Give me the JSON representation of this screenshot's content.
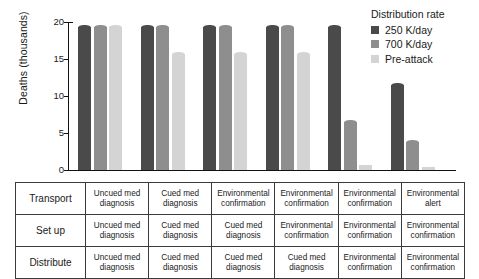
{
  "chart_data": {
    "type": "bar",
    "title": "",
    "xlabel": "",
    "ylabel": "Deaths (thousands)",
    "ylim": [
      0,
      20
    ],
    "yticks": [
      0,
      5,
      10,
      15,
      20
    ],
    "ytick_labels": [
      "0",
      "5",
      "10",
      "15",
      "20"
    ],
    "grid": false,
    "legend_position": "top-right",
    "legend_title": "Distribution rate",
    "categories": [
      "Scenario 1",
      "Scenario 2",
      "Scenario 3",
      "Scenario 4",
      "Scenario 5",
      "Scenario 6"
    ],
    "series": [
      {
        "name": "250 K/day",
        "color": "#4a4a4a",
        "values": [
          19.6,
          19.6,
          19.6,
          19.6,
          19.6,
          11.7
        ]
      },
      {
        "name": "700 K/day",
        "color": "#8e8e8e",
        "values": [
          19.6,
          19.6,
          19.6,
          19.6,
          6.7,
          4.0
        ]
      },
      {
        "name": "Pre-attack",
        "color": "#d4d4d4",
        "values": [
          19.6,
          16.0,
          16.0,
          16.0,
          0.7,
          0.35
        ]
      }
    ]
  },
  "legend": {
    "title": "Distribution rate",
    "items": [
      {
        "label": "250 K/day",
        "color": "#4a4a4a"
      },
      {
        "label": "700 K/day",
        "color": "#8e8e8e"
      },
      {
        "label": "Pre-attack",
        "color": "#d4d4d4"
      }
    ]
  },
  "axis": {
    "y_title": "Deaths (thousands)",
    "y_tick_labels": [
      "20",
      "15",
      "10",
      "5",
      "0"
    ]
  },
  "matrix": {
    "rows": [
      {
        "label": "Transport",
        "cells": [
          "Uncued med diagnosis",
          "Cued med diagnosis",
          "Environmental confirmation",
          "Environmental confirmation",
          "Environmental confirmation",
          "Environmental alert"
        ]
      },
      {
        "label": "Set up",
        "cells": [
          "Uncued med diagnosis",
          "Cued med diagnosis",
          "Cued med diagnosis",
          "Environmental confirmation",
          "Environmental confirmation",
          "Environmental confirmation"
        ]
      },
      {
        "label": "Distribute",
        "cells": [
          "Uncued med diagnosis",
          "Cued med diagnosis",
          "Cued med diagnosis",
          "Cued med diagnosis",
          "Environmental confirmation",
          "Environmental confirmation"
        ]
      }
    ]
  }
}
